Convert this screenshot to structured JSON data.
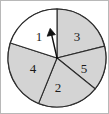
{
  "figure": {
    "type": "spinner-wheel",
    "title": "",
    "background_color": "#ffffff",
    "width": 109,
    "height": 114
  },
  "wheel": {
    "center_x": 57,
    "center_y": 58,
    "radius": 49,
    "outline_color": "#2b2b2b",
    "shaded_color": "#d4d4d4",
    "unshaded_color": "#ffffff",
    "sector_count": 5,
    "sectors": [
      {
        "label": "1",
        "shaded": false,
        "fill": "#ffffff",
        "start_angle_deg": 90,
        "end_angle_deg": 162,
        "label_x": 39,
        "label_y": 38
      },
      {
        "label": "3",
        "shaded": true,
        "fill": "#d4d4d4",
        "start_angle_deg": 14,
        "end_angle_deg": 90,
        "label_x": 77,
        "label_y": 38
      },
      {
        "label": "5",
        "shaded": true,
        "fill": "#d4d4d4",
        "start_angle_deg": -39,
        "end_angle_deg": 14,
        "label_x": 84,
        "label_y": 70
      },
      {
        "label": "2",
        "shaded": true,
        "fill": "#d4d4d4",
        "start_angle_deg": -112,
        "end_angle_deg": -39,
        "label_x": 58,
        "label_y": 89
      },
      {
        "label": "4",
        "shaded": true,
        "fill": "#d4d4d4",
        "start_angle_deg": -198,
        "end_angle_deg": -112,
        "label_x": 33,
        "label_y": 70
      }
    ]
  },
  "pointer": {
    "name": "spinner-arrow",
    "color": "#101010",
    "tail_x": 57,
    "tail_y": 58,
    "tip_x": 50,
    "tip_y": 29,
    "direction_deg": 103,
    "points_to_sector": "1"
  },
  "frame": {
    "border_color": "#b8b8b8",
    "visible": true
  }
}
